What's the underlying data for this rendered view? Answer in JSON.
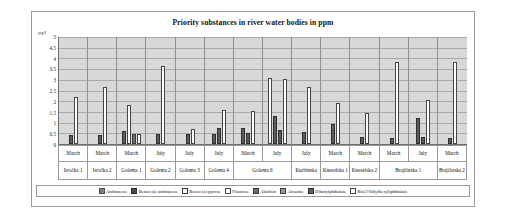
{
  "chart_data": {
    "type": "bar",
    "title": "Priority substances in river water bodies in ppm",
    "xlabel": "",
    "ylabel": "µg/l",
    "ylim": [
      0,
      5
    ],
    "ytick_labels": [
      "5",
      "4.5",
      "4",
      "3.5",
      "3",
      "2.5",
      "2",
      "1.5",
      "1",
      "0.5",
      "0"
    ],
    "grid": true,
    "legend_position": "bottom",
    "categories": [
      "Istočka 1",
      "Istočka 2",
      "Golema 1",
      "Golema 2",
      "Golema 3",
      "Golema 4",
      "Golema 6",
      "Kurbinska",
      "Knеselska 1",
      "Knеselska 2",
      "Brajčinska 1",
      "Brajčinska 2"
    ],
    "months": [
      "March",
      "March",
      "March",
      "July",
      "July",
      "July",
      "March",
      "July",
      "July",
      "March",
      "March",
      "March",
      "July",
      "March"
    ],
    "columns": [
      {
        "month": "March",
        "site": "Istočka 1",
        "span": 1
      },
      {
        "month": "March",
        "site": "Istočka 2",
        "span": 1
      },
      {
        "month": "March",
        "site": "Golema 1",
        "span": 1
      },
      {
        "month": "July",
        "site": "Golema 2",
        "span": 1
      },
      {
        "month": "July",
        "site": "Golema 3",
        "span": 1
      },
      {
        "month": "July",
        "site": "Golema 4",
        "span": 1
      },
      {
        "month": "March",
        "site": "Golema 6",
        "span": 2
      },
      {
        "month": "July",
        "site": "",
        "span": 0
      },
      {
        "month": "July",
        "site": "Kurbinska",
        "span": 1
      },
      {
        "month": "March",
        "site": "Knеselska 1",
        "span": 1
      },
      {
        "month": "March",
        "site": "Knеselska 2",
        "span": 1
      },
      {
        "month": "March",
        "site": "Brajčinska 1",
        "span": 2
      },
      {
        "month": "July",
        "site": "",
        "span": 0
      },
      {
        "month": "March",
        "site": "Brajčinska 2",
        "span": 1
      }
    ],
    "series": [
      {
        "name": "Anthracene",
        "swatch": "s0"
      },
      {
        "name": "Benzo (a) anthracene",
        "swatch": "s1"
      },
      {
        "name": "Benzo (a) pyrene",
        "swatch": "s2"
      },
      {
        "name": "Fluorene",
        "swatch": "s3"
      },
      {
        "name": "Alachlor",
        "swatch": "s4"
      },
      {
        "name": "Atrazine",
        "swatch": "s5"
      },
      {
        "name": "Dibutylphthalate",
        "swatch": "s6"
      },
      {
        "name": "Bis(2-Ethylhexyl)phthalate",
        "swatch": "s8"
      }
    ],
    "groups": [
      {
        "label": "March / Istočka 1",
        "bars": [
          {
            "s": 6,
            "v": 0.4
          },
          {
            "s": 8,
            "v": 2.2
          }
        ]
      },
      {
        "label": "March / Istočka 2",
        "bars": [
          {
            "s": 6,
            "v": 0.4
          },
          {
            "s": 8,
            "v": 2.65
          }
        ]
      },
      {
        "label": "March / Golema 1",
        "bars": [
          {
            "s": 6,
            "v": 0.6
          },
          {
            "s": 8,
            "v": 1.8
          },
          {
            "s": 4,
            "v": 0.45
          },
          {
            "s": 8,
            "v": 0.45
          }
        ]
      },
      {
        "label": "July / Golema 2",
        "bars": [
          {
            "s": 6,
            "v": 0.45
          },
          {
            "s": 8,
            "v": 3.65
          }
        ]
      },
      {
        "label": "July / Golema 3",
        "bars": [
          {
            "s": 6,
            "v": 0.45
          },
          {
            "s": 8,
            "v": 0.7
          }
        ]
      },
      {
        "label": "July / Golema 4",
        "bars": [
          {
            "s": 6,
            "v": 0.45
          },
          {
            "s": 6,
            "v": 0.75
          },
          {
            "s": 8,
            "v": 1.6
          }
        ]
      },
      {
        "label": "March / Golema 6",
        "bars": [
          {
            "s": 6,
            "v": 0.75
          },
          {
            "s": 6,
            "v": 0.5
          },
          {
            "s": 8,
            "v": 1.55
          }
        ]
      },
      {
        "label": "July / Golema 6",
        "bars": [
          {
            "s": 8,
            "v": 3.1
          },
          {
            "s": 6,
            "v": 1.3
          },
          {
            "s": 6,
            "v": 0.65
          },
          {
            "s": 8,
            "v": 3.05
          }
        ]
      },
      {
        "label": "July / Kurbinska",
        "bars": [
          {
            "s": 6,
            "v": 0.55
          },
          {
            "s": 8,
            "v": 2.65
          }
        ]
      },
      {
        "label": "March / Knеselska 1",
        "bars": [
          {
            "s": 6,
            "v": 0.95
          },
          {
            "s": 8,
            "v": 1.9
          }
        ]
      },
      {
        "label": "March / Knеselska 2",
        "bars": [
          {
            "s": 6,
            "v": 0.35
          },
          {
            "s": 8,
            "v": 1.45
          }
        ]
      },
      {
        "label": "March / Brajčinska 1",
        "bars": [
          {
            "s": 6,
            "v": 0.3
          },
          {
            "s": 8,
            "v": 3.85
          }
        ]
      },
      {
        "label": "July / Brajčinska 1",
        "bars": [
          {
            "s": 6,
            "v": 1.2
          },
          {
            "s": 6,
            "v": 0.35
          },
          {
            "s": 8,
            "v": 2.05
          }
        ]
      },
      {
        "label": "March / Brajčinska 2",
        "bars": [
          {
            "s": 6,
            "v": 0.3
          },
          {
            "s": 8,
            "v": 3.85
          }
        ]
      }
    ]
  }
}
